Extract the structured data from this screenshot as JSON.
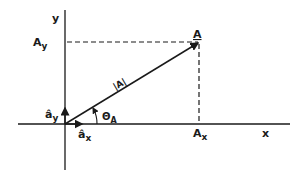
{
  "diagram": {
    "type": "vector-components",
    "axes": {
      "x_label": "x",
      "y_label": "y"
    },
    "vector": {
      "name": "A",
      "magnitude_label": "|A|",
      "angle_label": "Θ",
      "angle_subscript": "A"
    },
    "components": {
      "x_label": "A",
      "x_subscript": "x",
      "y_label": "A",
      "y_subscript": "y"
    },
    "unit_vectors": {
      "x_label": "â",
      "x_subscript": "x",
      "y_label": "â",
      "y_subscript": "y"
    },
    "colors": {
      "ink": "#1a1a1a",
      "background": "#ffffff"
    }
  }
}
